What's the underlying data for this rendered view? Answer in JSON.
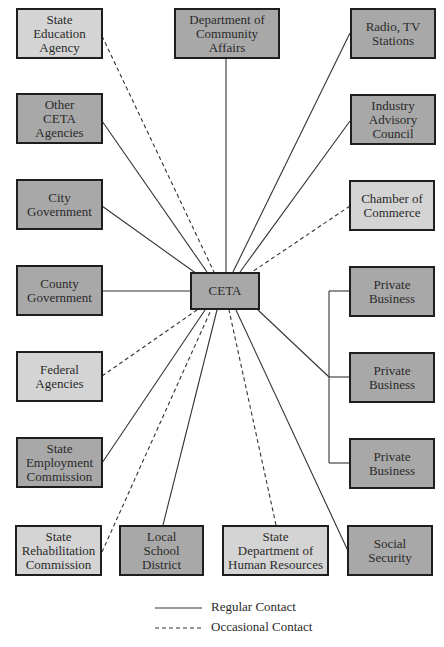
{
  "diagram": {
    "center": {
      "label": "CETA",
      "shade": "dark"
    },
    "nodes": [
      {
        "id": "state-education-agency",
        "label": "State\nEducation\nAgency",
        "shade": "light",
        "contact": "occasional"
      },
      {
        "id": "department-community-affairs",
        "label": "Department of\nCommunity\nAffairs",
        "shade": "dark",
        "contact": "regular"
      },
      {
        "id": "radio-tv-stations",
        "label": "Radio, TV\nStations",
        "shade": "dark",
        "contact": "regular"
      },
      {
        "id": "other-ceta-agencies",
        "label": "Other\nCETA\nAgencies",
        "shade": "dark",
        "contact": "regular"
      },
      {
        "id": "industry-advisory-council",
        "label": "Industry\nAdvisory\nCouncil",
        "shade": "dark",
        "contact": "regular"
      },
      {
        "id": "city-government",
        "label": "City\nGovernment",
        "shade": "dark",
        "contact": "regular"
      },
      {
        "id": "chamber-of-commerce",
        "label": "Chamber of\nCommerce",
        "shade": "light",
        "contact": "occasional"
      },
      {
        "id": "county-government",
        "label": "County\nGovernment",
        "shade": "dark",
        "contact": "regular"
      },
      {
        "id": "private-business-1",
        "label": "Private\nBusiness",
        "shade": "dark",
        "contact": "regular"
      },
      {
        "id": "federal-agencies",
        "label": "Federal\nAgencies",
        "shade": "light",
        "contact": "occasional"
      },
      {
        "id": "private-business-2",
        "label": "Private\nBusiness",
        "shade": "dark",
        "contact": "regular"
      },
      {
        "id": "state-employment-commission",
        "label": "State\nEmployment\nCommission",
        "shade": "dark",
        "contact": "regular"
      },
      {
        "id": "private-business-3",
        "label": "Private\nBusiness",
        "shade": "dark",
        "contact": "regular"
      },
      {
        "id": "state-rehabilitation-commission",
        "label": "State\nRehabilitation\nCommission",
        "shade": "light",
        "contact": "occasional"
      },
      {
        "id": "local-school-district",
        "label": "Local\nSchool\nDistrict",
        "shade": "dark",
        "contact": "regular"
      },
      {
        "id": "state-department-human-resources",
        "label": "State\nDepartment of\nHuman Resources",
        "shade": "light",
        "contact": "occasional"
      },
      {
        "id": "social-security",
        "label": "Social\nSecurity",
        "shade": "dark",
        "contact": "regular"
      }
    ]
  },
  "legend": {
    "regular": "Regular Contact",
    "occasional": "Occasional Contact"
  },
  "colors": {
    "dark_fill": "#a8a8a8",
    "light_fill": "#d4d4d4",
    "border": "#1e1e1e",
    "line": "#333333"
  }
}
